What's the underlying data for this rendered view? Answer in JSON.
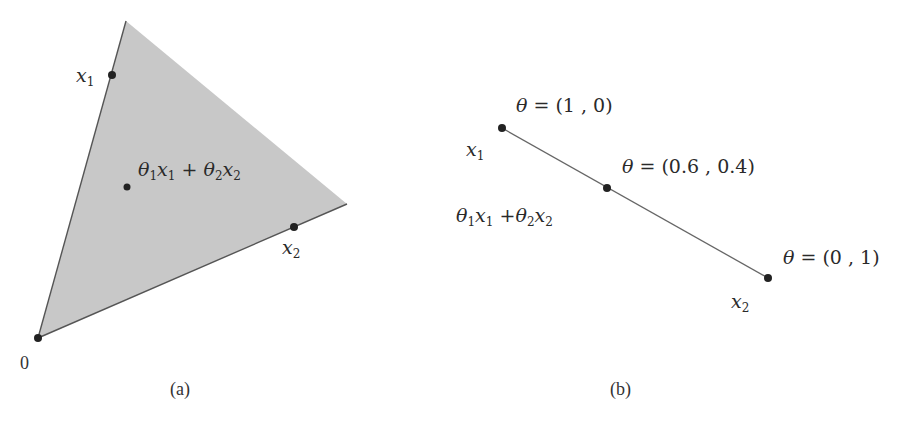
{
  "panel_a": {
    "caption": "(a)",
    "fill_color": "#c8c8c8",
    "edge_color": "#555555",
    "labels": {
      "x1": {
        "base": "x",
        "sub": "1"
      },
      "x2": {
        "base": "x",
        "sub": "2"
      },
      "origin": "0",
      "combo": {
        "t1": "θ",
        "s1": "1",
        "x1": "x",
        "sx1": "1",
        "plus": "+",
        "t2": "θ",
        "s2": "2",
        "x2": "x",
        "sx2": "2"
      }
    }
  },
  "panel_b": {
    "caption": "(b)",
    "line_color": "#666666",
    "labels": {
      "x1": {
        "base": "x",
        "sub": "1"
      },
      "x2": {
        "base": "x",
        "sub": "2"
      },
      "theta_top": {
        "theta": "θ",
        "eq": " = ",
        "val": "(1 , 0)"
      },
      "theta_mid": {
        "theta": "θ",
        "eq": " = ",
        "val": "(0.6 , 0.4)"
      },
      "theta_bot": {
        "theta": "θ",
        "eq": " = ",
        "val": "(0 , 1)"
      },
      "combo": {
        "t1": "θ",
        "s1": "1",
        "x1": "x",
        "sx1": "1",
        "plus": "+",
        "t2": "θ",
        "s2": "2",
        "x2": "x",
        "sx2": "2"
      }
    }
  },
  "colors": {
    "dot": "#222222",
    "text": "#2a2a2a"
  }
}
